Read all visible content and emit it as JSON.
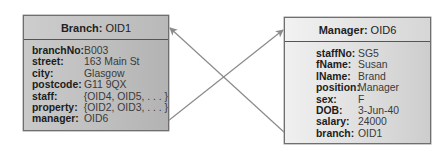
{
  "diagram": {
    "type": "object-instance-diagram",
    "colors": {
      "line": "#8a8a8a",
      "border": "#6f6f6f",
      "branch_fill": "#c4c4c4",
      "manager_fill": "#e4e4e4"
    },
    "objects": [
      {
        "id": "branch",
        "class_name": "Branch:",
        "oid": "OID1",
        "attributes": [
          {
            "key": "branchNo:",
            "value": "B003"
          },
          {
            "key": "street:",
            "value": "163 Main St"
          },
          {
            "key": "city:",
            "value": "Glasgow"
          },
          {
            "key": "postcode:",
            "value": "G11 9QX"
          },
          {
            "key": "staff:",
            "value": "{OID4, OID5, . . . }"
          },
          {
            "key": "property:",
            "value": "{OID2, OID3, . . . }"
          },
          {
            "key": "manager:",
            "value": "OID6"
          }
        ]
      },
      {
        "id": "manager",
        "class_name": "Manager:",
        "oid": "OID6",
        "attributes": [
          {
            "key": "staffNo:",
            "value": "SG5"
          },
          {
            "key": "fName:",
            "value": "Susan"
          },
          {
            "key": "lName:",
            "value": "Brand"
          },
          {
            "key": "position:",
            "value": "Manager"
          },
          {
            "key": "sex:",
            "value": "F"
          },
          {
            "key": "DOB:",
            "value": "3-Jun-40"
          },
          {
            "key": "salary:",
            "value": "24000"
          },
          {
            "key": "branch:",
            "value": "OID1"
          }
        ]
      }
    ],
    "links": [
      {
        "from": "branch.manager",
        "to": "manager",
        "label": "manager → OID6"
      },
      {
        "from": "manager.branch",
        "to": "branch",
        "label": "branch → OID1"
      }
    ]
  }
}
